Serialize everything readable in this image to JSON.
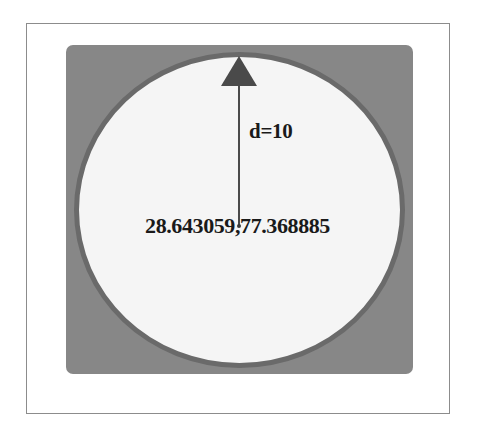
{
  "diagram": {
    "frame": {
      "name": "outer-frame"
    },
    "bounding_square": {
      "name": "bounding-square",
      "color": "#878787",
      "shape": "rounded-square"
    },
    "circle": {
      "name": "geofence-circle",
      "fill": "#f5f5f5",
      "stroke": "#6a6a6a",
      "shape": "circle"
    },
    "radius_arrow": {
      "name": "radius-arrow",
      "color": "#4a4a4a",
      "direction": "up",
      "from": "center",
      "to": "circle-edge"
    },
    "labels": {
      "distance": "d=10",
      "center_coordinate": "28.643059,77.368885"
    },
    "values": {
      "distance_value": 10,
      "latitude": "28.643059",
      "longitude": "77.368885"
    }
  }
}
